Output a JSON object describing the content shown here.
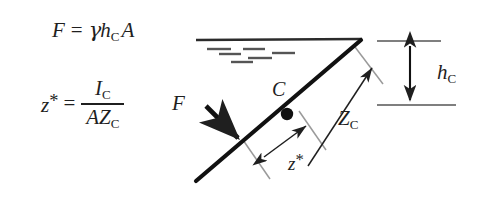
{
  "figure": {
    "background_color": "#ffffff",
    "ink_color": "#1f1f1f",
    "width": 477,
    "height": 202
  },
  "equations": {
    "force": {
      "name": "resultant-hydrostatic-force",
      "lhs": "F",
      "equals": "=",
      "gamma": "γ",
      "depth_symbol": "h",
      "depth_subscript": "C",
      "area_symbol": "A",
      "plain_text": "F = γ h_C A"
    },
    "center_of_pressure": {
      "name": "center-of-pressure-offset",
      "lhs_symbol": "z",
      "lhs_star": "*",
      "equals": "=",
      "numerator_symbol": "I",
      "numerator_subscript": "C",
      "denominator_area": "A",
      "denominator_symbol": "Z",
      "denominator_subscript": "C",
      "plain_text": "z* = I_C / (A Z_C)"
    }
  },
  "labels": {
    "force_arrow": "F",
    "centroid": "C",
    "slant_distance": "Z",
    "slant_distance_subscript": "C",
    "offset": "z",
    "offset_star": "*",
    "centroid_depth": "h",
    "centroid_depth_subscript": "C"
  },
  "diagram": {
    "free_surface_line": {
      "name": "free-surface-line",
      "x1": 196,
      "y1": 40,
      "x2": 362,
      "y2": 39
    },
    "free_surface_hatch_marks": [
      {
        "x1": 207,
        "y1": 49,
        "x2": 231,
        "y2": 49
      },
      {
        "x1": 243,
        "y1": 49,
        "x2": 265,
        "y2": 49
      },
      {
        "x1": 272,
        "y1": 53,
        "x2": 295,
        "y2": 53
      },
      {
        "x1": 219,
        "y1": 54,
        "x2": 241,
        "y2": 54
      },
      {
        "x1": 248,
        "y1": 58,
        "x2": 272,
        "y2": 58
      },
      {
        "x1": 231,
        "y1": 62,
        "x2": 253,
        "y2": 62
      }
    ],
    "inclined_plate": {
      "name": "inclined-plate",
      "x1": 196,
      "y1": 181,
      "x2": 361,
      "y2": 40,
      "stroke_width": 4.2
    },
    "centroid_point": {
      "name": "centroid-dot",
      "cx": 287,
      "cy": 114,
      "r": 6
    },
    "force_arrow": {
      "name": "force-arrow",
      "x1": 206,
      "y1": 106,
      "x2": 243,
      "y2": 143,
      "stroke_width": 4.6
    },
    "slant_arrow": {
      "name": "slant-distance-arrow",
      "x1": 308,
      "y1": 165,
      "x2": 375,
      "y2": 64,
      "stroke_width": 1.4
    },
    "offset_arrow": {
      "name": "offset-arrow",
      "x1": 263,
      "y1": 156,
      "x2": 308,
      "y2": 124,
      "stroke_width": 1.4
    },
    "tick_upper": {
      "name": "tick-at-centroid",
      "x1": 299,
      "y1": 111,
      "x2": 326,
      "y2": 150
    },
    "tick_lower": {
      "name": "tick-at-pressure-center",
      "x1": 243,
      "y1": 140,
      "x2": 270,
      "y2": 179
    },
    "tick_apex": {
      "name": "tick-at-surface",
      "x1": 355,
      "y1": 47,
      "x2": 383,
      "y2": 84
    },
    "depth_reference_upper": {
      "name": "depth-reference-line-top",
      "x1": 377,
      "y1": 41,
      "x2": 441,
      "y2": 41
    },
    "depth_reference_lower": {
      "name": "depth-reference-line-bottom",
      "x1": 377,
      "y1": 105,
      "x2": 456,
      "y2": 105
    },
    "depth_arrow": {
      "name": "centroid-depth-arrow",
      "x": 410,
      "y1": 44,
      "y2": 102,
      "stroke_width": 2.0
    }
  }
}
